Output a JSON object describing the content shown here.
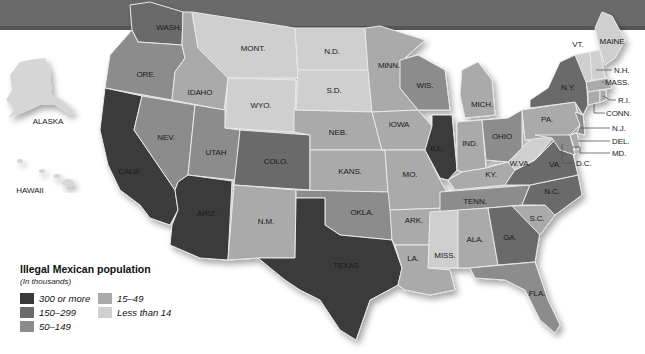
{
  "map": {
    "title": "Illegal Mexican population",
    "subtitle": "(In thousands)",
    "legend": [
      {
        "label": "300 or more",
        "color": "#3a3a3a"
      },
      {
        "label": "150–299",
        "color": "#6b6b6b"
      },
      {
        "label": "50–149",
        "color": "#8c8c8c"
      },
      {
        "label": "15–49",
        "color": "#aaaaaa"
      },
      {
        "label": "Less than 14",
        "color": "#cfcfcf"
      }
    ],
    "states": {
      "wash": {
        "label": "WASH.",
        "category": "150–299"
      },
      "ore": {
        "label": "ORE.",
        "category": "50–149"
      },
      "calif": {
        "label": "CALIF.",
        "category": "300 or more"
      },
      "idaho": {
        "label": "IDAHO",
        "category": "15–49"
      },
      "nev": {
        "label": "NEV.",
        "category": "50–149"
      },
      "utah": {
        "label": "UTAH",
        "category": "50–149"
      },
      "ariz": {
        "label": "ARIZ.",
        "category": "300 or more"
      },
      "mont": {
        "label": "MONT.",
        "category": "Less than 14"
      },
      "wyo": {
        "label": "WYO.",
        "category": "Less than 14"
      },
      "colo": {
        "label": "COLO.",
        "category": "150–299"
      },
      "nm": {
        "label": "N.M.",
        "category": "15–49"
      },
      "nd": {
        "label": "N.D.",
        "category": "Less than 14"
      },
      "sd": {
        "label": "S.D.",
        "category": "Less than 14"
      },
      "neb": {
        "label": "NEB.",
        "category": "15–49"
      },
      "kans": {
        "label": "KANS.",
        "category": "15–49"
      },
      "okla": {
        "label": "OKLA.",
        "category": "50–149"
      },
      "texas": {
        "label": "TEXAS",
        "category": "300 or more"
      },
      "minn": {
        "label": "MINN.",
        "category": "15–49"
      },
      "iowa": {
        "label": "IOWA",
        "category": "15–49"
      },
      "mo": {
        "label": "MO.",
        "category": "15–49"
      },
      "ark": {
        "label": "ARK.",
        "category": "15–49"
      },
      "la": {
        "label": "LA.",
        "category": "15–49"
      },
      "wis": {
        "label": "WIS.",
        "category": "50–149"
      },
      "ill": {
        "label": "ILL.",
        "category": "300 or more"
      },
      "mich": {
        "label": "MICH.",
        "category": "15–49"
      },
      "ind": {
        "label": "IND.",
        "category": "15–49"
      },
      "ohio": {
        "label": "OHIO",
        "category": "50–149"
      },
      "ky": {
        "label": "KY.",
        "category": "15–49"
      },
      "tenn": {
        "label": "TENN.",
        "category": "50–149"
      },
      "miss": {
        "label": "MISS.",
        "category": "Less than 14"
      },
      "ala": {
        "label": "ALA.",
        "category": "15–49"
      },
      "ga": {
        "label": "GA.",
        "category": "150–299"
      },
      "fla": {
        "label": "FLA.",
        "category": "50–149"
      },
      "sc": {
        "label": "S.C.",
        "category": "15–49"
      },
      "nc": {
        "label": "N.C.",
        "category": "150–299"
      },
      "va": {
        "label": "VA.",
        "category": "150–299"
      },
      "wva": {
        "label": "W.VA.",
        "category": "Less than 14"
      },
      "pa": {
        "label": "PA.",
        "category": "15–49"
      },
      "ny": {
        "label": "N.Y.",
        "category": "150–299"
      },
      "vt": {
        "label": "VT.",
        "category": "Less than 14"
      },
      "maine": {
        "label": "MAINE",
        "category": "Less than 14"
      },
      "nh": {
        "label": "N.H.",
        "category": "Less than 14"
      },
      "mass": {
        "label": "MASS.",
        "category": "15–49"
      },
      "ri": {
        "label": "R.I.",
        "category": "15–49"
      },
      "conn": {
        "label": "CONN.",
        "category": "15–49"
      },
      "nj": {
        "label": "N.J.",
        "category": "50–149"
      },
      "del": {
        "label": "DEL.",
        "category": "15–49"
      },
      "md": {
        "label": "MD.",
        "category": "50–149"
      },
      "dc": {
        "label": "D.C.",
        "category": "Less than 14"
      },
      "alaska": {
        "label": "ALASKA",
        "category": "Less than 14"
      },
      "hawaii": {
        "label": "HAWAII",
        "category": "Less than 14"
      }
    }
  }
}
